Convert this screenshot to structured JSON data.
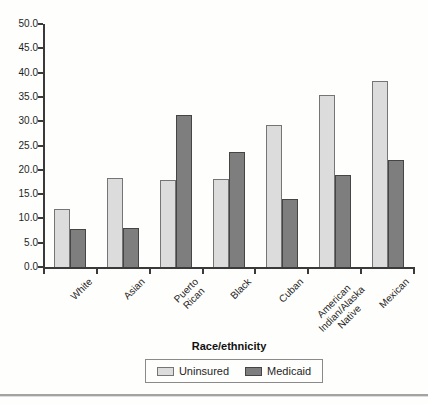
{
  "figure": {
    "background": "#fefefc"
  },
  "chart_data": {
    "type": "bar",
    "title": "",
    "xlabel": "Race/ethnicity",
    "ylabel": "",
    "ylim": [
      0,
      50
    ],
    "ytick_step": 5,
    "ytick_labels": [
      "0.0",
      "5.0",
      "10.0",
      "15.0",
      "20.0",
      "25.0",
      "30.0",
      "35.0",
      "40.0",
      "45.0",
      "50.0"
    ],
    "grid": false,
    "legend_position": "bottom",
    "categories": [
      "White",
      "Asian",
      "Puerto Rican",
      "Black",
      "Cuban",
      "American Indian/Alaska Native",
      "Mexican"
    ],
    "category_label_lines": [
      [
        "White"
      ],
      [
        "Asian"
      ],
      [
        "Puerto",
        "Rican"
      ],
      [
        "Black"
      ],
      [
        "Cuban"
      ],
      [
        "American",
        "Indian/Alaska",
        "Native"
      ],
      [
        "Mexican"
      ]
    ],
    "series": [
      {
        "name": "Uninsured",
        "values": [
          11.9,
          18.3,
          17.9,
          18.2,
          29.3,
          35.4,
          38.3
        ],
        "fill": "#dcdcdc",
        "border": "#757575"
      },
      {
        "name": "Medicaid",
        "values": [
          7.9,
          8.1,
          31.2,
          23.6,
          14.0,
          18.9,
          22.1
        ],
        "fill": "#7e7e7e",
        "border": "#454545"
      }
    ],
    "axis_color": "#3a3a3a"
  }
}
